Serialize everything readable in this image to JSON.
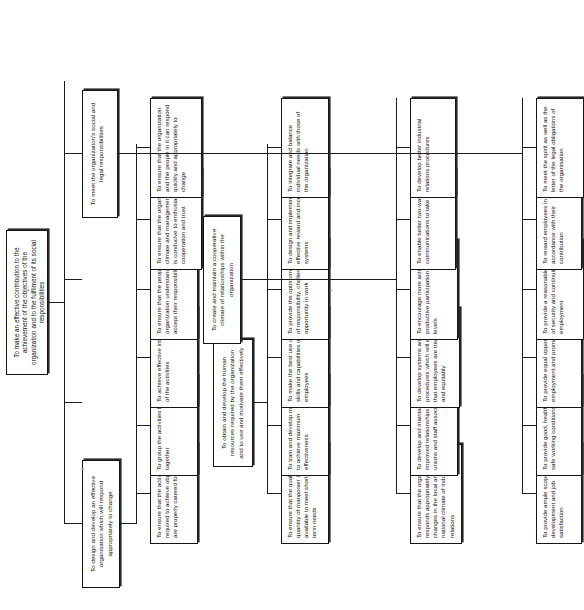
{
  "diagram": {
    "type": "tree",
    "orientation": "text-rotated-90-ccw",
    "title_text": "Personnel management objectives hierarchy",
    "root": {
      "id": "root",
      "label": "To make an effective contribution to the achievement of the objectives of the organization and to the fulfilment of its social responsibilities"
    },
    "branches": [
      {
        "id": "branch-organisation-design",
        "label": "To design and develop an effective organisation which will respond appropriately to change",
        "leaves": [
          {
            "id": "leaf-1-1",
            "label": "To ensure that the activities required to achieve objectives are properly catered for"
          },
          {
            "id": "leaf-1-2",
            "label": "To group the activities logically together"
          },
          {
            "id": "leaf-1-3",
            "label": "To achieve effective integration of the activities"
          },
          {
            "id": "leaf-1-4",
            "label": "To ensure that the people in the organization understand and accept their responsibilities"
          },
          {
            "id": "leaf-1-5",
            "label": "To ensure that the organisation climate and management style is conducive to enthusiasm, cooperation and trust"
          },
          {
            "id": "leaf-1-6",
            "label": "To ensure that the organization and the people in it can respond quickly and appropriately to change"
          }
        ]
      },
      {
        "id": "branch-human-resources",
        "label": "To obtain and develop the human resources required by the organization and to use and motivate them effectively",
        "leaves": [
          {
            "id": "leaf-2-1",
            "label": "To ensure that the quality and quantity of manpower is available to meet short and long term needs"
          },
          {
            "id": "leaf-2-2",
            "label": "To train and develop manpower to achieve maximum effectiveness"
          },
          {
            "id": "leaf-2-3",
            "label": "To make the best use of the skills and capabilities of employees"
          },
          {
            "id": "leaf-2-4",
            "label": "To provide the optimum amount of responsibility, challenge and opportunity in work"
          },
          {
            "id": "leaf-2-5",
            "label": "To design and implement effective reward and incentive systems"
          },
          {
            "id": "leaf-2-6",
            "label": "To integrate and balance individual needs with those of the organization"
          }
        ]
      },
      {
        "id": "branch-cooperative-climate",
        "label": "To create and maintain a cooperative climate of relationships within the organization",
        "leaves": [
          {
            "id": "leaf-3-1",
            "label": "To ensure that the organization responds appropriately to changes in the local and national climate of industrial relations"
          },
          {
            "id": "leaf-3-2",
            "label": "To develop and maintain improved relationships with unions and staff associations"
          },
          {
            "id": "leaf-3-3",
            "label": "To develop systems and procedures which will ensure that employees are treated fairly and equitably"
          },
          {
            "id": "leaf-3-4",
            "label": "To encourage more active and productive participation at all levels"
          },
          {
            "id": "leaf-3-5",
            "label": "To enable better two-way communications to take place"
          },
          {
            "id": "leaf-3-6",
            "label": "To develop better industrial relations procedures"
          }
        ]
      },
      {
        "id": "branch-social-legal",
        "label": "To meet the organization's social and legal responsibilities",
        "leaves": [
          {
            "id": "leaf-4-1",
            "label": "To provide ample scope for self-development and job satisfaction"
          },
          {
            "id": "leaf-4-2",
            "label": "To provide good, healthy and safe working conditions"
          },
          {
            "id": "leaf-4-3",
            "label": "To provide equal opportunity for employment and promotion"
          },
          {
            "id": "leaf-4-4",
            "label": "To provide a reasonable degree of security and continuity of employment"
          },
          {
            "id": "leaf-4-5",
            "label": "To reward employees in accordance with their contribution"
          },
          {
            "id": "leaf-4-6",
            "label": "To meet the spirit as well as the letter of the legal obligations of the organisation"
          }
        ]
      }
    ],
    "colors": {
      "box_border": "#151515",
      "box_fill": "#ffffff",
      "text": "#111111",
      "connector": "#1d1d1d",
      "page_background": "#ffffff"
    }
  }
}
